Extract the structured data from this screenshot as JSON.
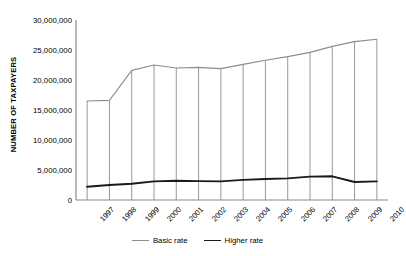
{
  "chart_data": {
    "type": "line",
    "title": "",
    "subtitle": "",
    "xlabel": "",
    "ylabel": "NUMBER OF TAXPAYERS",
    "categories": [
      "1997",
      "1998",
      "1999",
      "2000",
      "2001",
      "2002",
      "2003",
      "2004",
      "2005",
      "2006",
      "2007",
      "2008",
      "2009",
      "2010"
    ],
    "ylim": [
      0,
      30000000
    ],
    "ytick_labels": [
      "30,000,000",
      "25,000,000",
      "20,000,000",
      "15,000,000",
      "10,000,000",
      "5,000,000",
      "0"
    ],
    "ytick_values": [
      30000000,
      25000000,
      20000000,
      15000000,
      10000000,
      5000000,
      0
    ],
    "grid": "vertical-droplines",
    "legend_position": "bottom-center",
    "series": [
      {
        "name": "Basic rate",
        "color": "#8d8d8d",
        "width": 1.1,
        "values": [
          16500000,
          16600000,
          21600000,
          22500000,
          22000000,
          22100000,
          21900000,
          22600000,
          23300000,
          23900000,
          24600000,
          25600000,
          26400000,
          26800000
        ]
      },
      {
        "name": "Higher rate",
        "color": "#1a1a1a",
        "width": 1.9,
        "values": [
          2200000,
          2500000,
          2700000,
          3100000,
          3200000,
          3150000,
          3100000,
          3350000,
          3500000,
          3600000,
          3900000,
          3950000,
          3000000,
          3100000
        ]
      }
    ]
  },
  "legend": {
    "items": [
      {
        "label": "Basic rate"
      },
      {
        "label": "Higher rate"
      }
    ]
  },
  "axis": {
    "y_title": "NUMBER OF TAXPAYERS"
  }
}
